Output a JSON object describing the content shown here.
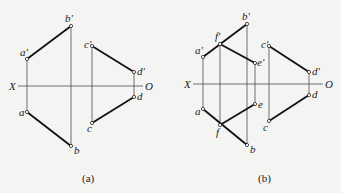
{
  "panels": [
    {
      "caption": "(a)",
      "axis": {
        "x_label": "X",
        "o_label": "O"
      },
      "points": {
        "a_prime": "a'",
        "b_prime": "b'",
        "c_prime": "c'",
        "d_prime": "d'",
        "a": "a",
        "b": "b",
        "c": "c",
        "d": "d"
      }
    },
    {
      "caption": "(b)",
      "axis": {
        "x_label": "X",
        "o_label": "O"
      },
      "points": {
        "a_prime": "a'",
        "b_prime": "b'",
        "c_prime": "c'",
        "d_prime": "d'",
        "e_prime": "e'",
        "f_prime": "f'",
        "a": "a",
        "b": "b",
        "c": "c",
        "d": "d",
        "e": "e",
        "f": "f"
      }
    }
  ]
}
